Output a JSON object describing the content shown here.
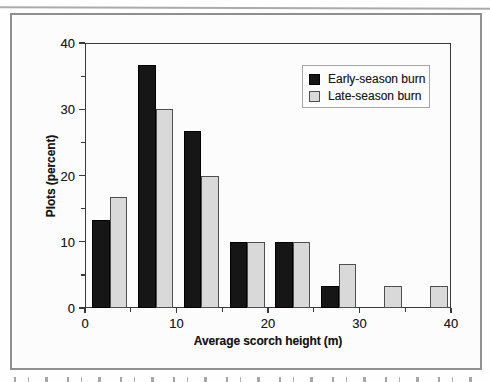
{
  "chart_data": {
    "type": "bar",
    "categories": [
      2.5,
      7.5,
      12.5,
      17.5,
      22.5,
      27.5,
      32.5,
      37.5
    ],
    "bin_width_m": 5,
    "series": [
      {
        "name": "Early-season burn",
        "color": "#161616",
        "border": "#000000",
        "values": [
          13.3,
          36.7,
          26.7,
          10,
          10,
          3.3,
          0,
          0
        ]
      },
      {
        "name": "Late-season burn",
        "color": "#d9d9d9",
        "border": "#4f4f4f",
        "values": [
          16.7,
          30,
          20,
          10,
          10,
          6.7,
          3.3,
          3.3
        ]
      }
    ],
    "title": "",
    "xlabel": "Average scorch height (m)",
    "ylabel": "Plots (percent)",
    "xlim": [
      0,
      40
    ],
    "ylim": [
      0,
      40
    ],
    "x_major_ticks": [
      0,
      10,
      20,
      30,
      40
    ],
    "x_minor_step": 5,
    "y_major_ticks": [
      0,
      10,
      20,
      30,
      40
    ],
    "y_minor_step": 5,
    "grid": false,
    "legend_position": "top-right"
  },
  "figure": {
    "frame_color": "#8f8f8f",
    "plot_frame_color": "#3a3a3a",
    "background": "#fcfcfc"
  }
}
